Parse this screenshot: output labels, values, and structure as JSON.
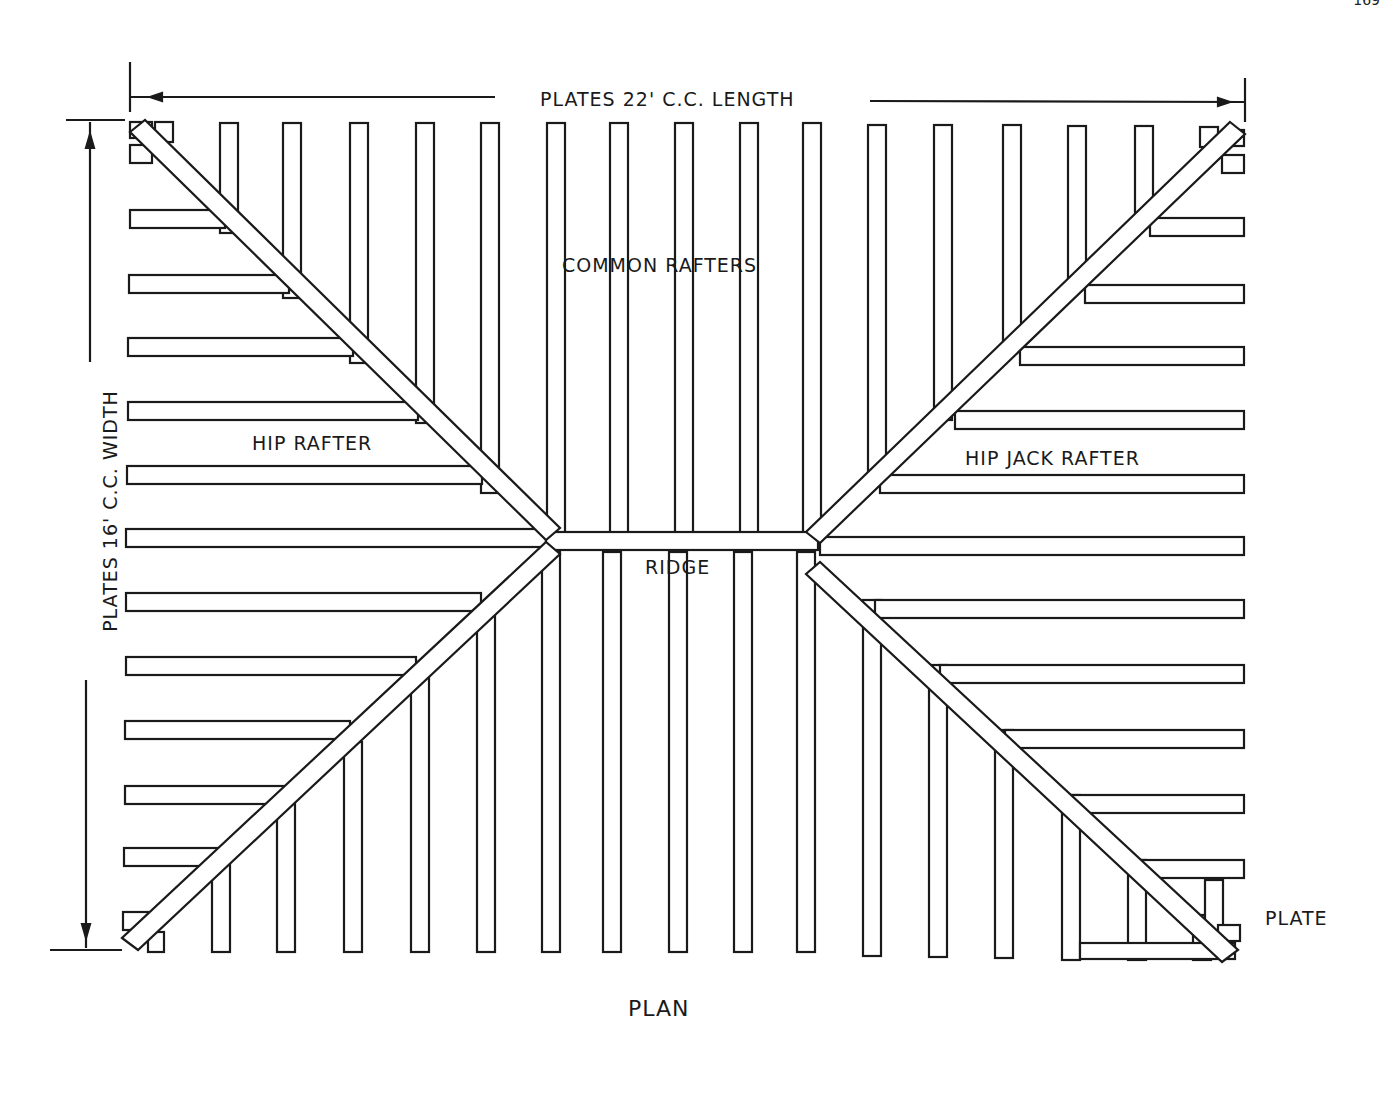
{
  "page": {
    "number": "169"
  },
  "diagram": {
    "title": "Plan",
    "labels": {
      "length": "Plates 22' C.C. Length",
      "width": "Plates 16' C.C. Width",
      "common_rafters": "Common Rafters",
      "hip_rafter": "Hip Rafter",
      "hip_jack_rafter": "Hip Jack Rafter",
      "ridge": "Ridge",
      "plate": "Plate",
      "plan": "Plan"
    },
    "colors": {
      "ink": "#1a1a1a",
      "paper": "#ffffff"
    }
  }
}
